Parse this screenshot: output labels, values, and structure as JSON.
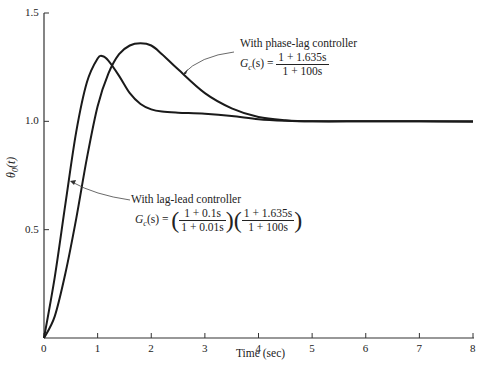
{
  "chart_data": {
    "type": "line",
    "title": "",
    "xlabel": "Time (sec)",
    "ylabel": "θ0(t)",
    "xlim": [
      0,
      8
    ],
    "ylim": [
      0,
      1.5
    ],
    "x_ticks": [
      "0",
      "1",
      "2",
      "3",
      "4",
      "5",
      "6",
      "7",
      "8"
    ],
    "y_ticks": [
      "0.5",
      "1.0",
      "1.5"
    ],
    "grid": false,
    "series": [
      {
        "name": "With lag-lead controller",
        "x": [
          0,
          0.2,
          0.4,
          0.6,
          0.8,
          1.0,
          1.1,
          1.2,
          1.4,
          1.6,
          1.8,
          2.0,
          2.2,
          2.5,
          3.0,
          3.5,
          4.0,
          4.5,
          5,
          6,
          7,
          8
        ],
        "y": [
          0,
          0.28,
          0.62,
          0.95,
          1.18,
          1.29,
          1.3,
          1.28,
          1.21,
          1.13,
          1.08,
          1.055,
          1.045,
          1.04,
          1.035,
          1.025,
          1.01,
          1.003,
          1.0,
          1.0,
          1.0,
          1.0
        ]
      },
      {
        "name": "With phase-lag controller",
        "x": [
          0,
          0.2,
          0.4,
          0.6,
          0.8,
          1.0,
          1.2,
          1.4,
          1.6,
          1.8,
          2.0,
          2.2,
          2.5,
          3.0,
          3.5,
          4.0,
          4.5,
          5,
          6,
          7,
          8
        ],
        "y": [
          0,
          0.1,
          0.3,
          0.55,
          0.83,
          1.07,
          1.22,
          1.31,
          1.35,
          1.36,
          1.35,
          1.31,
          1.24,
          1.13,
          1.06,
          1.02,
          1.005,
          1.0,
          1.0,
          1.0,
          0.998
        ]
      }
    ],
    "annotations": [
      {
        "text": "With phase-lag controller",
        "formula": "Gc(s) = (1 + 1.635s) / (1 + 100s)"
      },
      {
        "text": "With lag-lead controller",
        "formula": "Gc(s) = ((1 + 0.1s)/(1 + 0.01s)) ((1 + 1.635s)/(1 + 100s))"
      }
    ],
    "legend": "none (inline annotations with arrows)"
  },
  "labels": {
    "xlabel": "Time (sec)",
    "ylabel_main": "θ",
    "ylabel_sub": "0",
    "ylabel_arg": "(t)",
    "phase_lag": {
      "title": "With phase-lag controller",
      "lhs": "G",
      "lhs_sub": "c",
      "lhs_arg": "(s) =",
      "num": "1 + 1.635s",
      "den": "1 + 100s"
    },
    "lag_lead": {
      "title": "With lag-lead controller",
      "lhs": "G",
      "lhs_sub": "c",
      "lhs_arg": "(s) =",
      "num1": "1 + 0.1s",
      "den1": "1 + 0.01s",
      "num2": "1 + 1.635s",
      "den2": "1 + 100s"
    }
  }
}
